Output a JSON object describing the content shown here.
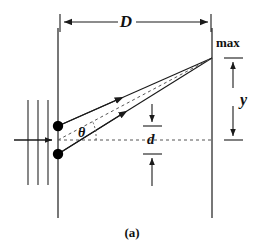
{
  "figure": {
    "caption": "(a)",
    "stroke_color": "#1a1a1a",
    "dash_color": "#555555",
    "background": "#ffffff"
  },
  "labels": {
    "distance_to_screen": "D",
    "maximum": "max",
    "fringe_position": "y",
    "slit_separation": "d",
    "angle": "θ"
  },
  "geometry": {
    "barrier_x": 58,
    "screen_x": 212,
    "barrier_top_y": 28,
    "barrier_bottom_y": 218,
    "slit_top_y": 126,
    "slit_bottom_y": 154,
    "center_axis_y": 140,
    "max_point_y": 58,
    "dimension_arrow_D_y": 22,
    "dimension_arrow_y_x": 232,
    "dimension_arrow_d_x": 152,
    "wavefront_x": [
      28,
      38,
      48
    ],
    "wavefront_top_y": 100,
    "wavefront_bottom_y": 185,
    "incoming_arrow_y": 140
  },
  "elements": {
    "ray_upper_name": "ray-from-upper-slit",
    "ray_lower_name": "ray-from-lower-slit",
    "ray_center_name": "central-axis-dashed-ray",
    "slit_upper_name": "upper-slit-source",
    "slit_lower_name": "lower-slit-source",
    "barrier_name": "slit-barrier-screen",
    "screen_name": "viewing-screen",
    "wavefronts_name": "incident-plane-wavefronts"
  }
}
